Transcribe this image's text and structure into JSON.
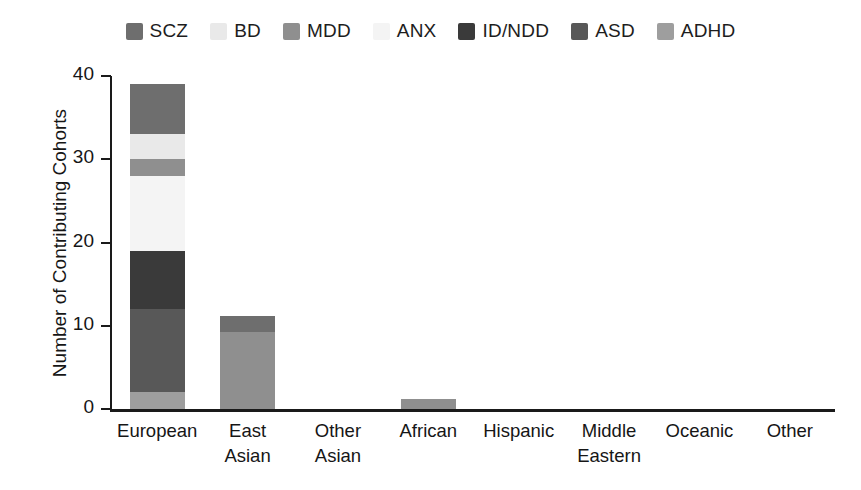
{
  "chart_data": {
    "type": "bar",
    "subtype": "stacked-vertical",
    "title": "",
    "xlabel": "",
    "ylabel": "Number of Contributing Cohorts",
    "ylim": [
      0,
      40
    ],
    "yticks": [
      0,
      10,
      20,
      30,
      40
    ],
    "ytick_labels": [
      "0",
      "10",
      "20",
      "30",
      "40"
    ],
    "grid": false,
    "legend_position": "top-center",
    "categories": [
      "European",
      "East Asian",
      "Other Asian",
      "African",
      "Hispanic",
      "Middle Eastern",
      "Oceanic",
      "Other"
    ],
    "category_lines": [
      [
        "European"
      ],
      [
        "East",
        "Asian"
      ],
      [
        "Other",
        "Asian"
      ],
      [
        "African"
      ],
      [
        "Hispanic"
      ],
      [
        "Middle",
        "Eastern"
      ],
      [
        "Oceanic"
      ],
      [
        "Other"
      ]
    ],
    "series": [
      {
        "name": "SCZ",
        "color": "#6e6e6e",
        "values": [
          6,
          2,
          0,
          0,
          0,
          0,
          0,
          0
        ]
      },
      {
        "name": "BD",
        "color": "#e9e9e9",
        "values": [
          3,
          0,
          0,
          0,
          0,
          0,
          0,
          0
        ]
      },
      {
        "name": "MDD",
        "color": "#8f8f8f",
        "values": [
          2,
          9.2,
          0,
          1.2,
          0,
          0,
          0,
          0
        ]
      },
      {
        "name": "ANX",
        "color": "#f4f4f4",
        "values": [
          9,
          0,
          0,
          0,
          0,
          0,
          0,
          0
        ]
      },
      {
        "name": "ID/NDD",
        "color": "#3a3a3a",
        "values": [
          7,
          0,
          0,
          0,
          0,
          0,
          0,
          0
        ]
      },
      {
        "name": "ASD",
        "color": "#585858",
        "values": [
          10,
          0,
          0,
          0,
          0,
          0,
          0,
          0
        ]
      },
      {
        "name": "ADHD",
        "color": "#9e9e9e",
        "values": [
          2,
          0,
          0,
          0,
          0,
          0,
          0,
          0
        ]
      }
    ],
    "totals": [
      39,
      11.2,
      0,
      1.2,
      0,
      0,
      0,
      0
    ]
  },
  "legend": {
    "items": [
      {
        "label": "SCZ",
        "color": "#6e6e6e"
      },
      {
        "label": "BD",
        "color": "#e9e9e9"
      },
      {
        "label": "MDD",
        "color": "#8f8f8f"
      },
      {
        "label": "ANX",
        "color": "#f4f4f4"
      },
      {
        "label": "ID/NDD",
        "color": "#3a3a3a"
      },
      {
        "label": "ASD",
        "color": "#585858"
      },
      {
        "label": "ADHD",
        "color": "#9e9e9e"
      }
    ]
  },
  "axes": {
    "y_title": "Number of Contributing Cohorts"
  }
}
